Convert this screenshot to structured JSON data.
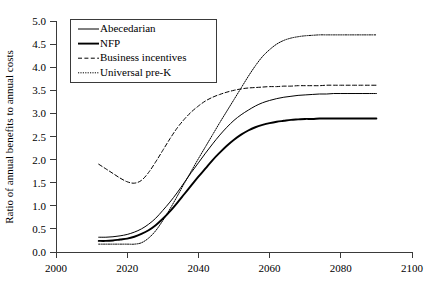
{
  "chart_data": {
    "type": "line",
    "title": "",
    "subtitle": "",
    "xlabel": "",
    "ylabel": "Ratio of annual benefits to annual costs",
    "xlim": [
      2000,
      2100
    ],
    "ylim": [
      0.0,
      5.0
    ],
    "xticks": [
      2000,
      2020,
      2040,
      2060,
      2080,
      2100
    ],
    "xtick_labels": [
      "2000",
      "2020",
      "2040",
      "2060",
      "2080",
      "2100"
    ],
    "yticks": [
      0.0,
      0.5,
      1.0,
      1.5,
      2.0,
      2.5,
      3.0,
      3.5,
      4.0,
      4.5,
      5.0
    ],
    "ytick_labels": [
      "0.0",
      "0.5",
      "1.0",
      "1.5",
      "2.0",
      "2.5",
      "3.0",
      "3.5",
      "4.0",
      "4.5",
      "5.0"
    ],
    "grid": false,
    "legend_position": "upper left (inside plot)",
    "x": [
      2012,
      2014,
      2016,
      2018,
      2020,
      2022,
      2024,
      2026,
      2028,
      2030,
      2032,
      2034,
      2036,
      2038,
      2040,
      2042,
      2044,
      2046,
      2048,
      2050,
      2052,
      2054,
      2056,
      2058,
      2060,
      2062,
      2064,
      2066,
      2068,
      2070,
      2072,
      2074,
      2076,
      2078,
      2080,
      2082,
      2084,
      2086,
      2088,
      2090
    ],
    "series": [
      {
        "name": "Abecedarian",
        "style": "solid-thin",
        "color": "#000000",
        "values": [
          0.32,
          0.32,
          0.33,
          0.35,
          0.38,
          0.43,
          0.5,
          0.6,
          0.73,
          0.9,
          1.08,
          1.28,
          1.5,
          1.72,
          1.93,
          2.14,
          2.34,
          2.53,
          2.7,
          2.85,
          2.97,
          3.07,
          3.16,
          3.23,
          3.28,
          3.32,
          3.35,
          3.37,
          3.39,
          3.4,
          3.41,
          3.42,
          3.42,
          3.43,
          3.43,
          3.43,
          3.43,
          3.43,
          3.43,
          3.43
        ]
      },
      {
        "name": "NFP",
        "style": "solid-thick",
        "color": "#000000",
        "values": [
          0.24,
          0.24,
          0.25,
          0.27,
          0.29,
          0.33,
          0.39,
          0.47,
          0.58,
          0.72,
          0.88,
          1.06,
          1.25,
          1.44,
          1.63,
          1.81,
          1.99,
          2.15,
          2.3,
          2.43,
          2.54,
          2.63,
          2.7,
          2.75,
          2.79,
          2.82,
          2.84,
          2.86,
          2.87,
          2.88,
          2.88,
          2.89,
          2.89,
          2.89,
          2.89,
          2.89,
          2.89,
          2.89,
          2.89,
          2.89
        ]
      },
      {
        "name": "Business incentives",
        "style": "dashed",
        "color": "#000000",
        "values": [
          1.9,
          1.8,
          1.7,
          1.6,
          1.52,
          1.49,
          1.55,
          1.72,
          1.95,
          2.2,
          2.45,
          2.68,
          2.87,
          3.03,
          3.16,
          3.27,
          3.35,
          3.41,
          3.46,
          3.5,
          3.53,
          3.55,
          3.56,
          3.57,
          3.58,
          3.58,
          3.59,
          3.59,
          3.6,
          3.6,
          3.6,
          3.6,
          3.61,
          3.61,
          3.61,
          3.61,
          3.61,
          3.61,
          3.61,
          3.61
        ]
      },
      {
        "name": "Universal pre-K",
        "style": "dotted",
        "color": "#000000",
        "values": [
          0.17,
          0.17,
          0.17,
          0.17,
          0.17,
          0.17,
          0.2,
          0.3,
          0.46,
          0.68,
          0.93,
          1.2,
          1.48,
          1.75,
          2.02,
          2.28,
          2.54,
          2.8,
          3.05,
          3.3,
          3.55,
          3.8,
          4.03,
          4.23,
          4.38,
          4.5,
          4.58,
          4.63,
          4.66,
          4.68,
          4.69,
          4.7,
          4.7,
          4.7,
          4.7,
          4.7,
          4.7,
          4.7,
          4.7,
          4.7
        ]
      }
    ],
    "annotations": []
  },
  "legend": {
    "entries": [
      {
        "label": "Abecedarian"
      },
      {
        "label": "NFP"
      },
      {
        "label": "Business incentives"
      },
      {
        "label": "Universal pre-K"
      }
    ]
  },
  "colors": {
    "axis": "#3a3a3a",
    "series": "#000000",
    "background": "#ffffff"
  }
}
